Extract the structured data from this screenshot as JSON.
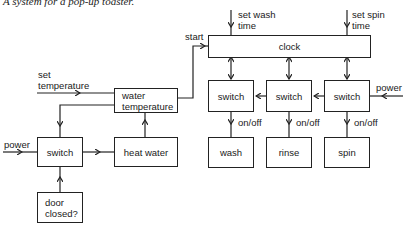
{
  "title": "A system for a pop-up toaster.",
  "diagram": {
    "blocks": {
      "water_temperature": {
        "line1": "water",
        "line2": "temperature"
      },
      "heat_water": "heat water",
      "left_switch": "switch",
      "door_closed": {
        "line1": "door",
        "line2": "closed?"
      },
      "clock": "clock",
      "switch_wash": "switch",
      "switch_rinse": "switch",
      "switch_spin": "switch",
      "wash": "wash",
      "rinse": "rinse",
      "spin": "spin"
    },
    "labels": {
      "set_temperature": {
        "line1": "set",
        "line2": "temperature"
      },
      "power_left": "power",
      "start": "start",
      "set_wash_time": {
        "line1": "set wash",
        "line2": "time"
      },
      "set_spin_time": {
        "line1": "set spin",
        "line2": "time"
      },
      "power_right": "power",
      "on_off_wash": "on/off",
      "on_off_rinse": "on/off",
      "on_off_spin": "on/off"
    },
    "edges": [
      {
        "from": "set temperature",
        "to": "water temperature"
      },
      {
        "from": "water temperature",
        "to": "clock",
        "label": "start"
      },
      {
        "from": "water temperature",
        "to": "left switch"
      },
      {
        "from": "power",
        "to": "left switch"
      },
      {
        "from": "left switch",
        "to": "heat water"
      },
      {
        "from": "heat water",
        "to": "water temperature"
      },
      {
        "from": "door closed?",
        "to": "left switch"
      },
      {
        "from": "set wash time",
        "to": "clock"
      },
      {
        "from": "set spin time",
        "to": "clock"
      },
      {
        "from": "clock",
        "to": "switch (wash)",
        "bidirectional": true
      },
      {
        "from": "clock",
        "to": "switch (rinse)",
        "bidirectional": true
      },
      {
        "from": "clock",
        "to": "switch (spin)",
        "bidirectional": true
      },
      {
        "from": "power",
        "to": "switch (spin)"
      },
      {
        "from": "switch (spin)",
        "to": "switch (rinse)"
      },
      {
        "from": "switch (rinse)",
        "to": "switch (wash)"
      },
      {
        "from": "switch (wash)",
        "to": "wash",
        "label": "on/off"
      },
      {
        "from": "switch (rinse)",
        "to": "rinse",
        "label": "on/off"
      },
      {
        "from": "switch (spin)",
        "to": "spin",
        "label": "on/off"
      }
    ]
  }
}
